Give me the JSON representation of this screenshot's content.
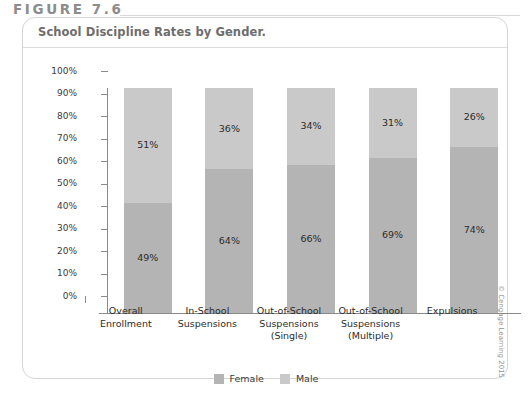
{
  "figure": {
    "header": "FIGURE 7.6",
    "title": "School Discipline Rates by Gender.",
    "credit": "© Cengage Learning 2015"
  },
  "colors": {
    "female": "#b4b4b4",
    "male": "#c9c9c9",
    "axis": "#8a8a8a",
    "card_border": "#d5d5d5",
    "header_text": "#8c8c8c",
    "title_text": "#6d6d6d"
  },
  "chart_data": {
    "type": "bar",
    "title": "School Discipline Rates by Gender.",
    "xlabel": "",
    "ylabel": "",
    "ylim": [
      0,
      100
    ],
    "stacked": true,
    "grid": false,
    "legend_position": "bottom",
    "categories": [
      "Overall\nEnrollment",
      "In-School\nSuspensions",
      "Out-of-School\nSuspensions\n(Single)",
      "Out-of-School\nSuspensions\n(Multiple)",
      "Expulsions"
    ],
    "category_lines": [
      [
        "Overall",
        "Enrollment"
      ],
      [
        "In-School",
        "Suspensions"
      ],
      [
        "Out-of-School",
        "Suspensions",
        "(Single)"
      ],
      [
        "Out-of-School",
        "Suspensions",
        "(Multiple)"
      ],
      [
        "Expulsions"
      ]
    ],
    "series": [
      {
        "name": "Female",
        "values": [
          49,
          64,
          66,
          69,
          74
        ],
        "labels": [
          "49%",
          "64%",
          "66%",
          "69%",
          "74%"
        ]
      },
      {
        "name": "Male",
        "values": [
          51,
          36,
          34,
          31,
          26
        ],
        "labels": [
          "51%",
          "36%",
          "34%",
          "31%",
          "26%"
        ]
      }
    ],
    "ytick_labels": [
      "100%",
      "90%",
      "80%",
      "70%",
      "60%",
      "50%",
      "40%",
      "30%",
      "20%",
      "10%",
      "0%"
    ],
    "ytick_values": [
      100,
      90,
      80,
      70,
      60,
      50,
      40,
      30,
      20,
      10,
      0
    ]
  },
  "legend": [
    {
      "label": "Female",
      "color": "#b4b4b4"
    },
    {
      "label": "Male",
      "color": "#c9c9c9"
    }
  ]
}
